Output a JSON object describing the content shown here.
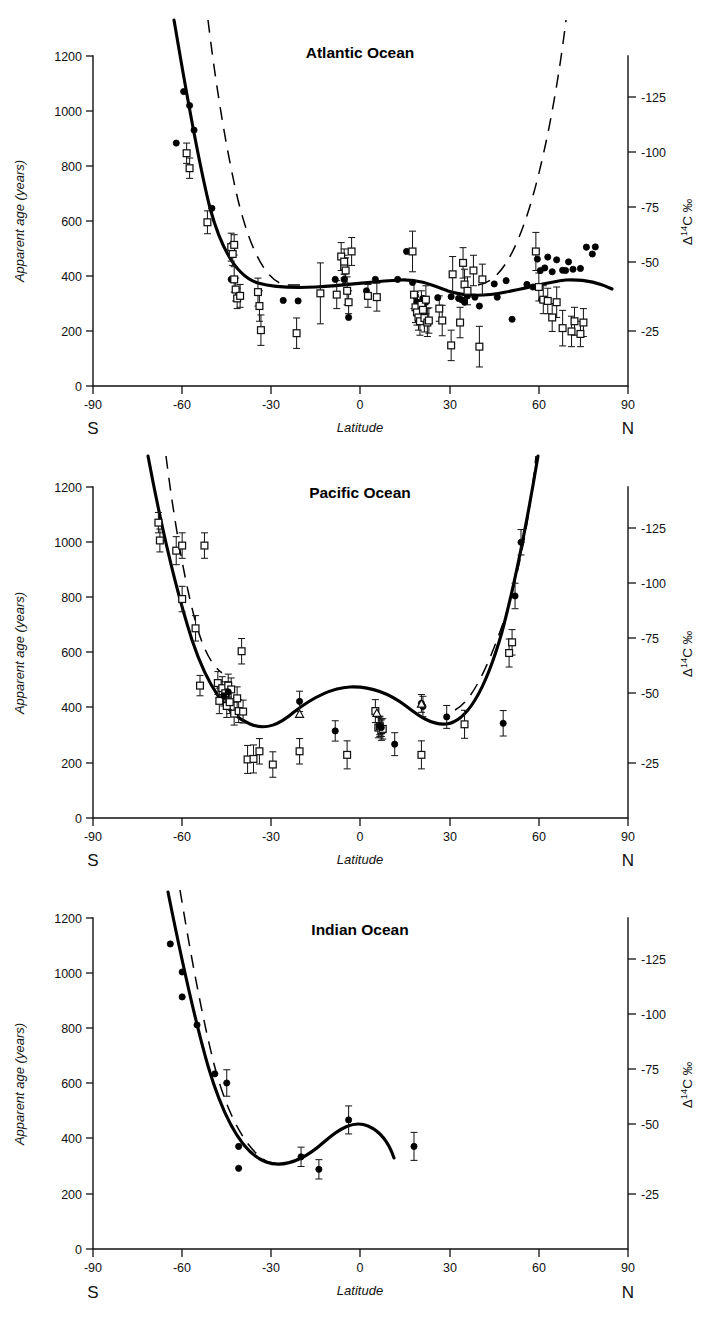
{
  "figure": {
    "name": "apparent-radiocarbon-age-vs-latitude",
    "panel_count": 3
  },
  "axes_common": {
    "ylabel": "Apparent age (years)",
    "xlabel": "Latitude",
    "right_label_delta": "Δ",
    "right_label_sup": "14",
    "right_label_rest": "C ‰",
    "south_label": "S",
    "north_label": "N",
    "x_ticks": [
      "-90",
      "-60",
      "-30",
      "0",
      "30",
      "60",
      "90"
    ],
    "x_tick_values": [
      -90,
      -60,
      -30,
      0,
      30,
      60,
      90
    ],
    "y_ticks": [
      "0",
      "200",
      "400",
      "600",
      "800",
      "1000",
      "1200"
    ],
    "y_tick_values": [
      0,
      200,
      400,
      600,
      800,
      1000,
      1200
    ],
    "y_right_ticks": [
      "-25",
      "-50",
      "-75",
      "-100",
      "-125"
    ],
    "y_right_tick_values": [
      -25,
      -50,
      -75,
      -100,
      -125
    ],
    "xlim": [
      -90,
      90
    ],
    "ylim": [
      0,
      1300
    ],
    "y_right_lim_years": [
      0,
      1300
    ],
    "grid": false,
    "legend": "none"
  },
  "chart_data": [
    {
      "type": "scatter",
      "title": "Atlantic Ocean",
      "xlabel": "Latitude",
      "ylabel": "Apparent age (years)",
      "y2label": "Δ14C ‰",
      "xlim": [
        -90,
        90
      ],
      "ylim": [
        0,
        1300
      ],
      "grid": false,
      "series": [
        {
          "name": "filled-circles",
          "marker": "filled-circle",
          "x": [
            -62,
            -59.5,
            -57.5,
            -56,
            -50,
            -43.5,
            -26,
            -21,
            -8.5,
            -5.5,
            -4,
            2,
            5,
            12.5,
            15.5,
            17.5,
            18.5,
            19,
            19.5,
            20,
            21,
            22,
            26,
            30.5,
            33,
            34,
            35,
            36,
            38.5,
            40,
            45,
            46,
            49,
            51,
            56,
            58,
            59.5,
            60.5,
            61,
            62,
            63,
            64.5,
            66,
            68,
            69,
            70,
            71.5,
            74,
            76,
            78,
            79
          ],
          "y": [
            957,
            1160,
            1105,
            1008,
            700,
            420,
            337,
            335,
            420,
            420,
            270,
            375,
            420,
            420,
            530,
            408,
            355,
            330,
            300,
            290,
            345,
            330,
            348,
            352,
            345,
            340,
            330,
            355,
            350,
            315,
            402,
            350,
            415,
            263,
            400,
            390,
            500,
            455,
            340,
            465,
            508,
            450,
            497,
            456,
            455,
            489,
            460,
            463,
            547,
            520,
            548
          ],
          "yerr": [
            0,
            0,
            0,
            0,
            0,
            0,
            0,
            0,
            0,
            0,
            0,
            0,
            0,
            0,
            0,
            0,
            0,
            0,
            0,
            0,
            0,
            0,
            0,
            0,
            0,
            0,
            0,
            0,
            0,
            0,
            0,
            0,
            0,
            0,
            0,
            0,
            0,
            0,
            0,
            0,
            0,
            0,
            0,
            0,
            0,
            0,
            0,
            0,
            0,
            0,
            0
          ]
        },
        {
          "name": "open-squares-with-error",
          "marker": "open-square",
          "x": [
            -58.5,
            -57.5,
            -51.5,
            -43.5,
            -43,
            -42.5,
            -42.5,
            -42,
            -41.5,
            -40.5,
            -34.5,
            -34,
            -33.5,
            -21.5,
            -13.5,
            -8,
            -6.5,
            -5.5,
            -5.5,
            -5,
            -4.5,
            -4,
            -3,
            2.5,
            5.5,
            17.5,
            18,
            18.5,
            19,
            19.5,
            20,
            20.5,
            21,
            21.5,
            22,
            22.5,
            23,
            26.5,
            27.5,
            30.5,
            31,
            33.5,
            34.5,
            35,
            36,
            38,
            40,
            41,
            59,
            60,
            61.5,
            63,
            64.5,
            66,
            68,
            71,
            72,
            74,
            75
          ],
          "y": [
            917,
            858,
            645,
            547,
            520,
            556,
            420,
            380,
            345,
            355,
            370,
            315,
            220,
            208,
            365,
            360,
            510,
            470,
            490,
            455,
            375,
            330,
            530,
            355,
            350,
            530,
            360,
            310,
            290,
            270,
            255,
            320,
            300,
            268,
            340,
            250,
            258,
            305,
            258,
            160,
            440,
            250,
            485,
            400,
            375,
            455,
            155,
            420,
            530,
            390,
            340,
            335,
            270,
            330,
            228,
            215,
            255,
            205,
            250
          ],
          "yerr": [
            40,
            40,
            45,
            55,
            45,
            40,
            50,
            45,
            40,
            45,
            55,
            60,
            60,
            60,
            120,
            55,
            55,
            45,
            50,
            50,
            55,
            45,
            55,
            45,
            55,
            80,
            55,
            60,
            50,
            50,
            55,
            55,
            50,
            55,
            55,
            55,
            50,
            50,
            60,
            60,
            70,
            60,
            60,
            60,
            55,
            60,
            80,
            60,
            75,
            55,
            55,
            50,
            55,
            60,
            70,
            60,
            55,
            50,
            55
          ]
        }
      ],
      "curves": [
        {
          "name": "solid-fit",
          "style": "solid"
        },
        {
          "name": "dashed-model",
          "style": "dashed"
        }
      ]
    },
    {
      "type": "scatter",
      "title": "Pacific Ocean",
      "xlabel": "Latitude",
      "ylabel": "Apparent age (years)",
      "y2label": "Δ14C ‰",
      "xlim": [
        -90,
        90
      ],
      "ylim": [
        0,
        1300
      ],
      "grid": false,
      "series": [
        {
          "name": "open-squares-with-error",
          "marker": "open-square",
          "x": [
            -68,
            -67.5,
            -62,
            -60,
            -60,
            -55.5,
            -54,
            -52.5,
            -48,
            -47.5,
            -46.5,
            -45.5,
            -45,
            -44.5,
            -44,
            -43.5,
            -42.5,
            -41.5,
            -41,
            -40,
            -39.5,
            -38,
            -36,
            -34,
            -29.5,
            -20.5,
            -4.5,
            5,
            6,
            6.5,
            7,
            7.5,
            20.5,
            35,
            50,
            51
          ],
          "y": [
            1160,
            1090,
            1050,
            1070,
            860,
            745,
            520,
            1070,
            530,
            460,
            510,
            490,
            440,
            520,
            455,
            505,
            410,
            470,
            420,
            655,
            418,
            230,
            232,
            262,
            210,
            262,
            248,
            420,
            355,
            360,
            345,
            350,
            248,
            368,
            648,
            690
          ],
          "yerr": [
            40,
            45,
            55,
            50,
            50,
            50,
            40,
            50,
            45,
            50,
            45,
            45,
            45,
            45,
            45,
            45,
            45,
            45,
            45,
            50,
            45,
            55,
            55,
            50,
            50,
            50,
            55,
            45,
            40,
            40,
            40,
            40,
            55,
            55,
            55,
            50
          ]
        },
        {
          "name": "filled-circles-with-error",
          "marker": "filled-circle",
          "x": [
            -46,
            -44.5,
            -20.5,
            -8.5,
            6.5,
            7,
            11.5,
            20.5,
            21,
            29,
            48,
            52,
            54
          ],
          "y": [
            480,
            495,
            458,
            342,
            362,
            355,
            290,
            450,
            438,
            397,
            372,
            872,
            1083
          ],
          "yerr": [
            40,
            40,
            40,
            40,
            35,
            35,
            45,
            35,
            40,
            45,
            50,
            50,
            50
          ]
        },
        {
          "name": "open-triangles",
          "marker": "open-triangle",
          "x": [
            -20.5,
            5.5,
            20.5
          ],
          "y": [
            408,
            412,
            448
          ],
          "yerr": [
            0,
            0,
            0
          ]
        }
      ],
      "curves": [
        {
          "name": "solid-fit",
          "style": "solid"
        },
        {
          "name": "dashed-model",
          "style": "dashed"
        }
      ]
    },
    {
      "type": "scatter",
      "title": "Indian Ocean",
      "xlabel": "Latitude",
      "ylabel": "Apparent age (years)",
      "y2label": "Δ14C ‰",
      "xlim": [
        -90,
        90
      ],
      "ylim": [
        0,
        1300
      ],
      "grid": false,
      "series": [
        {
          "name": "filled-circles-with-error",
          "marker": "filled-circle",
          "x": [
            -64,
            -60,
            -60,
            -55,
            -49,
            -45,
            -41,
            -41,
            -20,
            -14,
            -4,
            18
          ],
          "y": [
            1198,
            1088,
            990,
            880,
            688,
            652,
            403,
            317,
            362,
            313,
            507,
            403
          ],
          "yerr": [
            0,
            0,
            0,
            0,
            0,
            52,
            0,
            0,
            38,
            38,
            55,
            55
          ]
        }
      ],
      "curves": [
        {
          "name": "solid-fit",
          "style": "solid"
        },
        {
          "name": "dashed-model",
          "style": "dashed"
        }
      ]
    }
  ]
}
